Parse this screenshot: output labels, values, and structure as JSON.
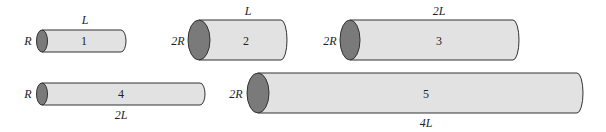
{
  "colors": {
    "body": "#e2e2e2",
    "end": "#7a7a7a",
    "stroke": "#333333"
  },
  "cylinders": [
    {
      "id": "1",
      "radius_label": "R",
      "length_label": "L",
      "length_pos": "top"
    },
    {
      "id": "2",
      "radius_label": "2R",
      "length_label": "L",
      "length_pos": "top"
    },
    {
      "id": "3",
      "radius_label": "2R",
      "length_label": "2L",
      "length_pos": "top"
    },
    {
      "id": "4",
      "radius_label": "R",
      "length_label": "2L",
      "length_pos": "bottom"
    },
    {
      "id": "5",
      "radius_label": "2R",
      "length_label": "4L",
      "length_pos": "bottom"
    }
  ]
}
